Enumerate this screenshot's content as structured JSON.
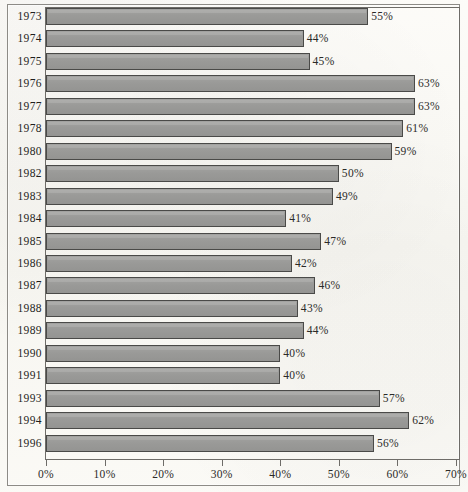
{
  "chart_data": {
    "type": "bar",
    "orientation": "horizontal",
    "title": "",
    "subtitle": "",
    "xlabel": "",
    "ylabel": "",
    "xlim": [
      0,
      70
    ],
    "grid": false,
    "legend": null,
    "value_suffix": "%",
    "xticks": [
      "0%",
      "10%",
      "20%",
      "30%",
      "40%",
      "50%",
      "60%",
      "70%"
    ],
    "xtick_values": [
      0,
      10,
      20,
      30,
      40,
      50,
      60,
      70
    ],
    "categories": [
      "1973",
      "1974",
      "1975",
      "1976",
      "1977",
      "1978",
      "1980",
      "1982",
      "1983",
      "1984",
      "1985",
      "1986",
      "1987",
      "1988",
      "1989",
      "1990",
      "1991",
      "1993",
      "1994",
      "1996"
    ],
    "values": [
      55,
      44,
      45,
      63,
      63,
      61,
      59,
      50,
      49,
      41,
      47,
      42,
      46,
      43,
      44,
      40,
      40,
      57,
      62,
      56
    ],
    "data_labels": [
      "55%",
      "44%",
      "45%",
      "63%",
      "63%",
      "61%",
      "59%",
      "50%",
      "49%",
      "41%",
      "47%",
      "42%",
      "46%",
      "43%",
      "44%",
      "40%",
      "40%",
      "57%",
      "62%",
      "56%"
    ],
    "bar_color": "#9a9a98",
    "bar_edge_color": "#4a4a48",
    "background_color": "#fbfaf7",
    "axis_color": "#6e6c68",
    "text_color": "#1f1e1c"
  }
}
